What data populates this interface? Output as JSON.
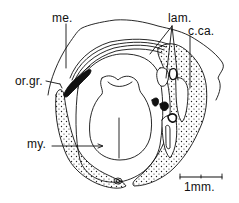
{
  "figure": {
    "type": "anatomical cross-section line drawing",
    "labels": {
      "me": "me.",
      "lam": "lam.",
      "cca": "c.ca.",
      "orgr": "or.gr.",
      "my": "my."
    },
    "scale_bar": {
      "label": "1mm.",
      "length_px": 42
    },
    "colors": {
      "ink": "#111111",
      "background": "#ffffff"
    }
  }
}
